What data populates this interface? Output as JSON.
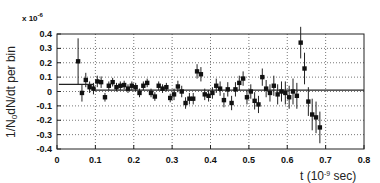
{
  "chart_data": {
    "type": "scatter",
    "title": "",
    "xlabel": "t (10^-9 sec)",
    "ylabel": "1/N0 dN/dt per bin",
    "y_multiplier": "x 10^-6",
    "xlim": [
      0,
      0.8
    ],
    "ylim": [
      -0.4,
      0.4
    ],
    "x_ticks": [
      "0",
      "0.1",
      "0.2",
      "0.3",
      "0.4",
      "0.5",
      "0.6",
      "0.7",
      "0.8"
    ],
    "y_ticks": [
      "0.4",
      "0.3",
      "0.2",
      "0.1",
      "0",
      "-0.1",
      "-0.2",
      "-0.3",
      "-0.4"
    ],
    "grid": true,
    "grid_style": "dotted",
    "legend": null,
    "series": [
      {
        "name": "data",
        "marker": "square",
        "error_bars": true,
        "points": [
          {
            "x": 0.055,
            "y": 0.21,
            "err": 0.16
          },
          {
            "x": 0.065,
            "y": -0.01,
            "err": 0.06
          },
          {
            "x": 0.075,
            "y": 0.08,
            "err": 0.05
          },
          {
            "x": 0.085,
            "y": 0.03,
            "err": 0.04
          },
          {
            "x": 0.095,
            "y": 0.02,
            "err": 0.04
          },
          {
            "x": 0.105,
            "y": 0.07,
            "err": 0.04
          },
          {
            "x": 0.115,
            "y": 0.065,
            "err": 0.04
          },
          {
            "x": 0.125,
            "y": -0.04,
            "err": 0.03
          },
          {
            "x": 0.135,
            "y": 0.04,
            "err": 0.03
          },
          {
            "x": 0.145,
            "y": 0.065,
            "err": 0.03
          },
          {
            "x": 0.155,
            "y": 0.03,
            "err": 0.03
          },
          {
            "x": 0.165,
            "y": 0.04,
            "err": 0.03
          },
          {
            "x": 0.175,
            "y": 0.045,
            "err": 0.03
          },
          {
            "x": 0.185,
            "y": 0.02,
            "err": 0.03
          },
          {
            "x": 0.195,
            "y": 0.04,
            "err": 0.03
          },
          {
            "x": 0.205,
            "y": 0.03,
            "err": 0.03
          },
          {
            "x": 0.215,
            "y": -0.01,
            "err": 0.03
          },
          {
            "x": 0.225,
            "y": 0.04,
            "err": 0.03
          },
          {
            "x": 0.235,
            "y": 0.06,
            "err": 0.03
          },
          {
            "x": 0.245,
            "y": -0.01,
            "err": 0.03
          },
          {
            "x": 0.255,
            "y": -0.035,
            "err": 0.03
          },
          {
            "x": 0.265,
            "y": 0.04,
            "err": 0.03
          },
          {
            "x": 0.275,
            "y": 0.02,
            "err": 0.03
          },
          {
            "x": 0.285,
            "y": 0.03,
            "err": 0.03
          },
          {
            "x": 0.295,
            "y": -0.045,
            "err": 0.03
          },
          {
            "x": 0.305,
            "y": -0.02,
            "err": 0.04
          },
          {
            "x": 0.315,
            "y": 0.035,
            "err": 0.04
          },
          {
            "x": 0.325,
            "y": 0.0,
            "err": 0.04
          },
          {
            "x": 0.335,
            "y": -0.08,
            "err": 0.04
          },
          {
            "x": 0.345,
            "y": -0.05,
            "err": 0.04
          },
          {
            "x": 0.355,
            "y": -0.05,
            "err": 0.04
          },
          {
            "x": 0.365,
            "y": 0.14,
            "err": 0.05
          },
          {
            "x": 0.375,
            "y": 0.12,
            "err": 0.05
          },
          {
            "x": 0.385,
            "y": -0.02,
            "err": 0.04
          },
          {
            "x": 0.395,
            "y": -0.03,
            "err": 0.04
          },
          {
            "x": 0.405,
            "y": -0.01,
            "err": 0.04
          },
          {
            "x": 0.415,
            "y": 0.04,
            "err": 0.05
          },
          {
            "x": 0.425,
            "y": 0.02,
            "err": 0.05
          },
          {
            "x": 0.435,
            "y": -0.06,
            "err": 0.05
          },
          {
            "x": 0.445,
            "y": 0.015,
            "err": 0.05
          },
          {
            "x": 0.455,
            "y": -0.08,
            "err": 0.05
          },
          {
            "x": 0.465,
            "y": 0.015,
            "err": 0.05
          },
          {
            "x": 0.475,
            "y": 0.06,
            "err": 0.05
          },
          {
            "x": 0.485,
            "y": 0.09,
            "err": 0.05
          },
          {
            "x": 0.495,
            "y": -0.04,
            "err": 0.05
          },
          {
            "x": 0.505,
            "y": 0.0,
            "err": 0.05
          },
          {
            "x": 0.515,
            "y": -0.065,
            "err": 0.06
          },
          {
            "x": 0.525,
            "y": -0.09,
            "err": 0.06
          },
          {
            "x": 0.535,
            "y": 0.1,
            "err": 0.06
          },
          {
            "x": 0.545,
            "y": 0.02,
            "err": 0.06
          },
          {
            "x": 0.555,
            "y": -0.01,
            "err": 0.06
          },
          {
            "x": 0.565,
            "y": 0.04,
            "err": 0.07
          },
          {
            "x": 0.575,
            "y": -0.02,
            "err": 0.07
          },
          {
            "x": 0.585,
            "y": 0.0,
            "err": 0.07
          },
          {
            "x": 0.595,
            "y": -0.01,
            "err": 0.08
          },
          {
            "x": 0.605,
            "y": -0.04,
            "err": 0.08
          },
          {
            "x": 0.615,
            "y": 0.0,
            "err": 0.09
          },
          {
            "x": 0.625,
            "y": -0.03,
            "err": 0.09
          },
          {
            "x": 0.635,
            "y": 0.34,
            "err": 0.11
          },
          {
            "x": 0.645,
            "y": 0.16,
            "err": 0.11
          },
          {
            "x": 0.655,
            "y": -0.07,
            "err": 0.1
          },
          {
            "x": 0.665,
            "y": -0.16,
            "err": 0.11
          },
          {
            "x": 0.675,
            "y": -0.18,
            "err": 0.11
          },
          {
            "x": 0.685,
            "y": -0.25,
            "err": 0.11
          }
        ]
      },
      {
        "name": "fit",
        "marker": "none",
        "line": [
          {
            "x": 0.005,
            "y": 0.05
          },
          {
            "x": 0.095,
            "y": 0.05
          },
          {
            "x": 0.095,
            "y": 0.01
          },
          {
            "x": 0.8,
            "y": 0.01
          }
        ]
      }
    ]
  }
}
